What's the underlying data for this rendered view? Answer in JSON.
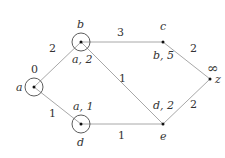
{
  "graph": {
    "nodes": {
      "a": {
        "name": "a",
        "distance": "0",
        "x": 34,
        "y": 87,
        "circled": true
      },
      "b": {
        "name": "b",
        "label": "a, 2",
        "x": 81,
        "y": 42,
        "circled": true
      },
      "c": {
        "name": "c",
        "label": "b, 5",
        "x": 163,
        "y": 42,
        "circled": false
      },
      "z": {
        "name": "z",
        "distance": "∞",
        "x": 210,
        "y": 79,
        "circled": false
      },
      "d": {
        "name": "d",
        "label": "a, 1",
        "x": 81,
        "y": 124,
        "circled": true
      },
      "e": {
        "name": "e",
        "label": "d, 2",
        "x": 163,
        "y": 124,
        "circled": false
      }
    },
    "edges": [
      {
        "from": "a",
        "to": "b",
        "weight": "2"
      },
      {
        "from": "a",
        "to": "d",
        "weight": "1"
      },
      {
        "from": "b",
        "to": "c",
        "weight": "3"
      },
      {
        "from": "b",
        "to": "e",
        "weight": "1"
      },
      {
        "from": "d",
        "to": "e",
        "weight": "1"
      },
      {
        "from": "c",
        "to": "z",
        "weight": "2"
      },
      {
        "from": "e",
        "to": "z",
        "weight": "2"
      }
    ]
  }
}
